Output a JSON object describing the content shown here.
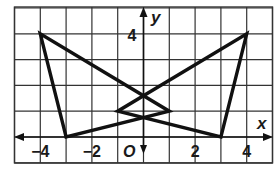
{
  "figure": {
    "axes": {
      "x_label": "x",
      "y_label": "y",
      "origin_label": "O",
      "x_ticks": [
        {
          "value": -4,
          "label": "−4"
        },
        {
          "value": -2,
          "label": "−2"
        },
        {
          "value": 2,
          "label": "2"
        },
        {
          "value": 4,
          "label": "4"
        }
      ],
      "y_ticks": [
        {
          "value": 4,
          "label": "4"
        }
      ],
      "x_range": [
        -5,
        5
      ],
      "y_range": [
        -1,
        5
      ]
    },
    "grid": true,
    "triangles": [
      {
        "name": "left-triangle",
        "vertices": [
          [
            -4,
            4
          ],
          [
            -3,
            0
          ],
          [
            1,
            1
          ]
        ]
      },
      {
        "name": "right-triangle",
        "vertices": [
          [
            4,
            4
          ],
          [
            3,
            0
          ],
          [
            -1,
            1
          ]
        ]
      }
    ],
    "colors": {
      "line": "#111111",
      "grid": "#333333",
      "background": "#ffffff"
    }
  }
}
